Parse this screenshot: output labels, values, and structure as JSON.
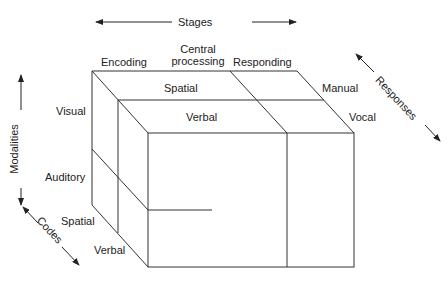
{
  "axes": {
    "stages": "Stages",
    "modalities": "Modalities",
    "codes": "Codes",
    "responses": "Responses"
  },
  "stages": [
    "Encoding",
    "Central\nprocessing",
    "Responding"
  ],
  "stage_central_line1": "Central",
  "stage_central_line2": "processing",
  "top_codes": {
    "spatial": "Spatial",
    "verbal": "Verbal"
  },
  "responses": {
    "manual": "Manual",
    "vocal": "Vocal"
  },
  "modalities": {
    "visual": "Visual",
    "auditory": "Auditory"
  },
  "left_codes": {
    "spatial": "Spatial",
    "verbal": "Verbal"
  }
}
